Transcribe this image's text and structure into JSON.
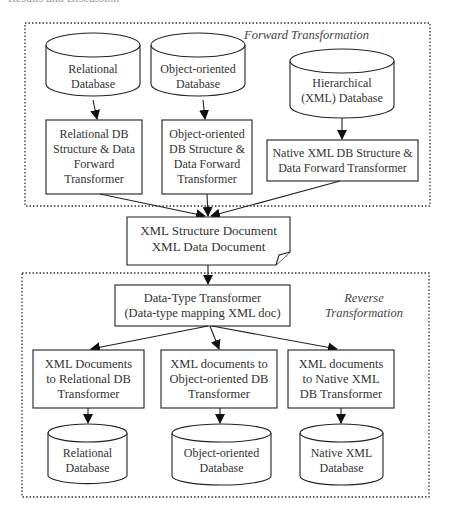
{
  "top_cut_text": "Results and Discussion",
  "forward": {
    "label": "Forward Transformation",
    "sources": [
      {
        "lines": [
          "Relational",
          "Database"
        ]
      },
      {
        "lines": [
          "Object-oriented",
          "Database"
        ]
      },
      {
        "lines": [
          "Hierarchical",
          "(XML) Database"
        ]
      }
    ],
    "transformers": [
      {
        "lines": [
          "Relational DB",
          "Structure & Data",
          "Forward",
          "Transformer"
        ]
      },
      {
        "lines": [
          "Object-oriented",
          "DB Structure &",
          "Data Forward",
          "Transformer"
        ]
      },
      {
        "lines": [
          "Native XML DB Structure &",
          "Data Forward Transformer"
        ]
      }
    ]
  },
  "document": {
    "lines": [
      "XML Structure Document",
      "XML Data Document"
    ]
  },
  "reverse": {
    "label_lines": [
      "Reverse",
      "Transformation"
    ],
    "datatype": {
      "lines": [
        "Data-Type Transformer",
        "(Data-type mapping XML doc)"
      ]
    },
    "transformers": [
      {
        "lines": [
          "XML Documents",
          "to Relational DB",
          "Transformer"
        ]
      },
      {
        "lines": [
          "XML documents to",
          "Object-oriented DB",
          "Transformer"
        ]
      },
      {
        "lines": [
          "XML documents",
          "to Native XML",
          "DB Transformer"
        ]
      }
    ],
    "targets": [
      {
        "lines": [
          "Relational",
          "Database"
        ]
      },
      {
        "lines": [
          "Object-oriented",
          "Database"
        ]
      },
      {
        "lines": [
          "Native XML",
          "Database"
        ]
      }
    ]
  },
  "colors": {
    "stroke": "#222222",
    "text": "#333333",
    "background": "#ffffff"
  }
}
